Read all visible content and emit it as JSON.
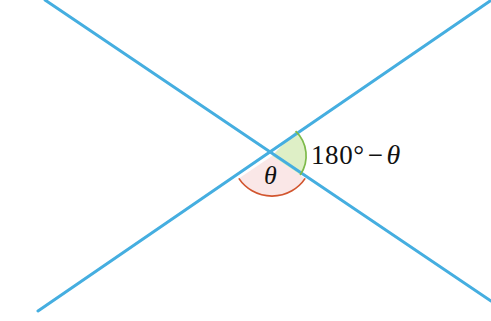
{
  "figure": {
    "canvas": {
      "width": 491,
      "height": 321,
      "background": "#ffffff"
    },
    "intersection_point": {
      "x": 272,
      "y": 156
    },
    "lines": [
      {
        "name": "line-descending",
        "from": {
          "x": 45,
          "y": 0
        },
        "to": {
          "x": 491,
          "y": 301
        },
        "color": "#45AEE0",
        "width": 3
      },
      {
        "name": "line-ascending",
        "from": {
          "x": 38,
          "y": 311
        },
        "to": {
          "x": 490,
          "y": 1
        },
        "color": "#45AEE0",
        "width": 3
      }
    ],
    "sectors": [
      {
        "name": "theta-sector",
        "label": "θ",
        "fill": "#FAE7E7",
        "arc_color": "#D2552E",
        "radius": 40,
        "start_deg": 214,
        "end_deg": 326
      },
      {
        "name": "supplement-sector",
        "label": "180° − θ",
        "fill": "#DEEFC6",
        "arc_color": "#7DBA4A",
        "radius": 34,
        "start_deg": 326,
        "end_deg": 394
      }
    ],
    "labels": {
      "theta": "θ",
      "supplement_number": "180",
      "supplement_degree": "°",
      "supplement_minus": "−",
      "supplement_theta": "θ"
    },
    "colors": {
      "line": "#45AEE0",
      "theta_fill": "#FAE7E7",
      "theta_arc": "#D2552E",
      "supplement_fill": "#DEEFC6",
      "supplement_arc": "#7DBA4A",
      "text": "#111111"
    }
  }
}
